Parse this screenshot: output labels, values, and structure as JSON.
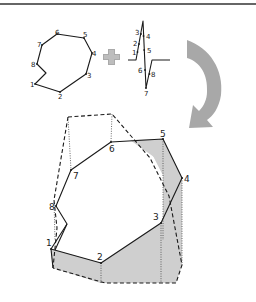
{
  "figure": {
    "top_rule": {
      "color": "#333333"
    },
    "colors": {
      "line": "#1a1a1a",
      "shade": "#cfcfcf",
      "arrow": "#a8a8a8",
      "plus": "#aaaaaa"
    },
    "outline_polygon": {
      "description": "Closed 8-vertex polygon (top-left)",
      "vertices": [
        {
          "label": "1",
          "x": 35,
          "y": 84
        },
        {
          "label": "2",
          "x": 60,
          "y": 92
        },
        {
          "label": "3",
          "x": 86,
          "y": 74
        },
        {
          "label": "4",
          "x": 92,
          "y": 53
        },
        {
          "label": "5",
          "x": 84,
          "y": 38
        },
        {
          "label": "6",
          "x": 57,
          "y": 34
        },
        {
          "label": "7",
          "x": 42,
          "y": 45
        },
        {
          "label": "8",
          "x": 37,
          "y": 64
        }
      ],
      "notch": {
        "x": 46,
        "y": 73
      }
    },
    "plus_sign": {
      "symbol": "+",
      "cx": 111,
      "cy": 57
    },
    "zigzag_profile": {
      "description": "Height profile of vertices (center-top)",
      "labels": [
        {
          "label": "1",
          "x": 134,
          "y": 52
        },
        {
          "label": "2",
          "x": 134,
          "y": 43
        },
        {
          "label": "3",
          "x": 137,
          "y": 33
        },
        {
          "label": "4",
          "x": 146,
          "y": 37
        },
        {
          "label": "5",
          "x": 147,
          "y": 51
        },
        {
          "label": "6",
          "x": 141,
          "y": 72
        },
        {
          "label": "7",
          "x": 146,
          "y": 96
        },
        {
          "label": "8",
          "x": 152,
          "y": 77
        }
      ]
    },
    "curved_arrow": {
      "direction": "clockwise-down-left"
    },
    "extruded_polygon": {
      "description": "3D folded polygon with dashed hidden edges and shaded faces",
      "vertices": [
        {
          "label": "1",
          "x": 51,
          "y": 249
        },
        {
          "label": "2",
          "x": 101,
          "y": 263
        },
        {
          "label": "3",
          "x": 161,
          "y": 223
        },
        {
          "label": "4",
          "x": 182,
          "y": 178
        },
        {
          "label": "5",
          "x": 163,
          "y": 139
        },
        {
          "label": "6",
          "x": 111,
          "y": 142
        },
        {
          "label": "7",
          "x": 71,
          "y": 170
        },
        {
          "label": "8",
          "x": 56,
          "y": 206
        }
      ]
    }
  }
}
